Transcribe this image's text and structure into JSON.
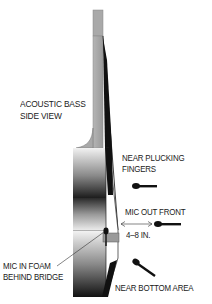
{
  "diagram": {
    "title_line1": "ACOUSTIC BASS",
    "title_line2": "SIDE VIEW",
    "labels": {
      "near_plucking_line1": "NEAR PLUCKING",
      "near_plucking_line2": "FINGERS",
      "mic_out_front": "MIC OUT FRONT",
      "distance": "4–8 IN.",
      "mic_in_foam_line1": "MIC IN FOAM",
      "mic_in_foam_line2": "BEHIND BRIDGE",
      "near_bottom": "NEAR BOTTOM AREA"
    },
    "microphone_positions": [
      {
        "name": "near-plucking-fingers"
      },
      {
        "name": "mic-out-front"
      },
      {
        "name": "near-bottom-area"
      },
      {
        "name": "mic-in-foam-behind-bridge"
      }
    ],
    "colors": {
      "ink": "#111111",
      "neck_gray": "#a8a8a8",
      "body_light": "#e8e8e8",
      "body_dark": "#1a1a1a",
      "bridge_gray": "#9a9a9a"
    }
  }
}
